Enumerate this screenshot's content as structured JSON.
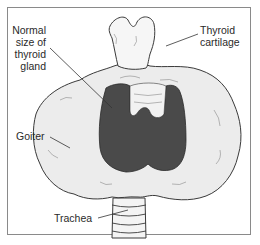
{
  "diagram": {
    "labels": {
      "normal_size": [
        "Normal",
        "size of",
        "thyroid",
        "gland"
      ],
      "thyroid_cartilage": [
        "Thyroid",
        "cartilage"
      ],
      "goiter": "Goiter",
      "trachea": "Trachea"
    },
    "colors": {
      "frame": "#8a8a8a",
      "goiter_fill": "#ececec",
      "normal_gland_fill": "#4a4a4a",
      "outline": "#3a3a3a",
      "leader_line": "#333333",
      "text": "#2a2a2a"
    }
  }
}
